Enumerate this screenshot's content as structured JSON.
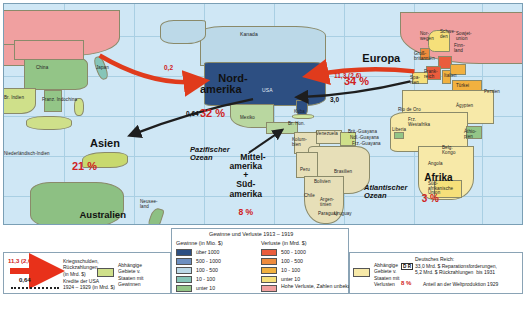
{
  "map": {
    "regions": [
      {
        "name": "Nordamerika",
        "label": "Nord-\namerika",
        "pct": "32 %"
      },
      {
        "name": "Europa",
        "label": "Europa",
        "pct": "34 %"
      },
      {
        "name": "Asien",
        "label": "Asien",
        "pct": "21 %"
      },
      {
        "name": "Australien",
        "label": "Australien",
        "pct": "2 %"
      },
      {
        "name": "Afrika",
        "label": "Afrika",
        "pct": "3 %"
      },
      {
        "name": "Mittel-Suedamerika",
        "label": "Mittel-\namerika\n+\nSüd-\namerika",
        "pct": "8 %"
      }
    ],
    "oceans": [
      {
        "label": "Pazifischer\nOzean"
      },
      {
        "label": "Atlantischer\nOzean"
      }
    ],
    "flows": [
      {
        "label": "0,2",
        "color": "#cf2222"
      },
      {
        "label": "11,3 (2,6)",
        "color": "#cf2222"
      },
      {
        "label": "3,0",
        "color": "#222222"
      },
      {
        "label": "0,64",
        "color": "#222222"
      }
    ],
    "place_labels": [
      "Sowjet-\nunion",
      "Nor-\nwegen",
      "Schwe-\nden",
      "Finn-\nland",
      "Groß-\nbritannien",
      "Frank-\nreich",
      "Spa-\nnien",
      "Italien",
      "Türkei",
      "Persien",
      "China",
      "Japan",
      "Br. Indien",
      "Franz. Indochina",
      "Niederländisch-Indien",
      "Neusee-\nland",
      "Kanada",
      "USA",
      "Mexiko",
      "Br. Hon.",
      "Kuba",
      "Kolum-\nbien",
      "Venezuela",
      "Brit.-Guayana",
      "Ndl.-Guayana",
      "Frz.-Guayana",
      "Brasilien",
      "Peru",
      "Bolivien",
      "Chile",
      "Argen-\ntinien",
      "Uruguay",
      "Paraguay",
      "Liberia",
      "Äthio-\npien",
      "Ägypten",
      "Süd-\nafrikanische\nUnion",
      "Rio de Oro",
      "Frz.\nWestafrika",
      "Belg.\nKongo",
      "Angola"
    ]
  },
  "legend_left": {
    "items": [
      {
        "num": "11,3 (2,6)",
        "text": "Kriegsschulden,\nRückzahlungen\n(in Mrd. $)",
        "type": "arrow"
      },
      {
        "num": "0,64",
        "text": "Kredite der USA\n1924 – 1929 (in Mrd. $)",
        "type": "dash"
      }
    ],
    "dependent": {
      "text": "Abhängige\nGebiete v.\nStaaten mit\nGewinnen"
    }
  },
  "legend_center": {
    "title": "Gewinne und Verluste 1913 – 1919",
    "gains_header": "Gewinne (in Mio. $)",
    "losses_header": "Verluste (in Mrd. $)",
    "gains": [
      {
        "label": "über 1000",
        "color": "#2d4f82"
      },
      {
        "label": "500 - 1000",
        "color": "#6d8fc0"
      },
      {
        "label": "100 - 500",
        "color": "#bcd9e8"
      },
      {
        "label": "10 - 100",
        "color": "#86c5b8"
      },
      {
        "label": "unter 10",
        "color": "#93c587"
      }
    ],
    "losses": [
      {
        "label": "500 - 1000",
        "color": "#ea5c3c"
      },
      {
        "label": "100 - 500",
        "color": "#ef8b3c"
      },
      {
        "label": "10 - 100",
        "color": "#f2b13f"
      },
      {
        "label": "unter 10",
        "color": "#f6e07a"
      },
      {
        "label": "Hohe Verluste,\nZahlen unbekannt",
        "color": "#f0a0a0"
      }
    ]
  },
  "legend_right": {
    "dependent": {
      "text": "Abhängige\nGebiete v.\nStaaten mit\nVerlusten"
    },
    "reich": {
      "badge": "D R",
      "title": "Deutsches Reich:",
      "text": "33,0 Mrd. $ Reparationsforderungen,\n5,2 Mrd. $ Rückzahlungen  bis 1931"
    },
    "share": {
      "num": "8 %",
      "text": "Anteil an der Weltproduktion 1929"
    }
  }
}
